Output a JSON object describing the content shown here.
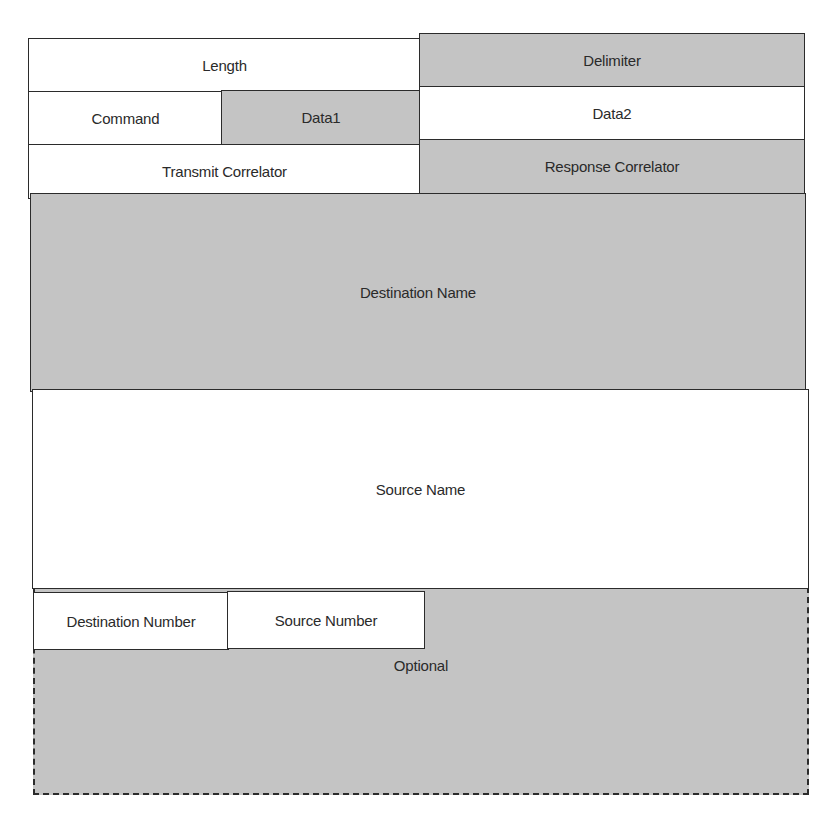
{
  "diagram": {
    "title": "",
    "fields": {
      "length": "Length",
      "delimiter": "Delimiter",
      "command": "Command",
      "data1": "Data1",
      "data2": "Data2",
      "transmit_correlator": "Transmit Correlator",
      "response_correlator": "Response Correlator",
      "destination_name": "Destination Name",
      "source_name": "Source Name",
      "destination_number": "Destination Number",
      "source_number": "Source Number",
      "optional": "Optional"
    },
    "colors": {
      "shaded_field": "#c4c4c4",
      "plain_field": "#ffffff",
      "border": "#2b2b2b"
    }
  }
}
